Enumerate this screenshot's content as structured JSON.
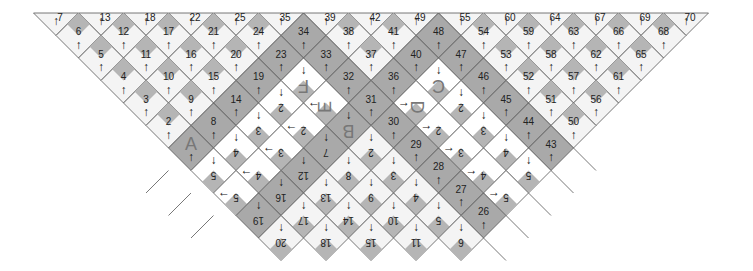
{
  "diagram": {
    "colors": {
      "dark": "#a9a9a9",
      "light": "#f4f4f4",
      "white": "#ffffff",
      "patch": "#b5b5b5",
      "line": "#555555"
    },
    "geometry": {
      "x0": 56,
      "y0": 13,
      "step": 22.5
    },
    "top_labels": [
      {
        "t": "7",
        "c": 0
      },
      {
        "t": "13",
        "c": 2
      },
      {
        "t": "18",
        "c": 4
      },
      {
        "t": "22",
        "c": 6
      },
      {
        "t": "25",
        "c": 8
      },
      {
        "t": "35",
        "c": 10
      },
      {
        "t": "39",
        "c": 12
      },
      {
        "t": "42",
        "c": 14
      },
      {
        "t": "49",
        "c": 16
      },
      {
        "t": "55",
        "c": 18
      },
      {
        "t": "60",
        "c": 20
      },
      {
        "t": "64",
        "c": 22
      },
      {
        "t": "67",
        "c": 24
      },
      {
        "t": "69",
        "c": 26
      },
      {
        "t": "70",
        "c": 28
      }
    ],
    "cells": [
      {
        "t": "6",
        "c": 1,
        "r": 1,
        "f": "light",
        "a": "up"
      },
      {
        "t": "12",
        "c": 3,
        "r": 1,
        "f": "light",
        "a": "up"
      },
      {
        "t": "17",
        "c": 5,
        "r": 1,
        "f": "light",
        "a": "up"
      },
      {
        "t": "21",
        "c": 7,
        "r": 1,
        "f": "light",
        "a": "up"
      },
      {
        "t": "24",
        "c": 9,
        "r": 1,
        "f": "light",
        "a": "up"
      },
      {
        "t": "34",
        "c": 11,
        "r": 1,
        "f": "dark",
        "a": "up"
      },
      {
        "t": "38",
        "c": 13,
        "r": 1,
        "f": "light",
        "a": "up"
      },
      {
        "t": "41",
        "c": 15,
        "r": 1,
        "f": "light",
        "a": "up"
      },
      {
        "t": "48",
        "c": 17,
        "r": 1,
        "f": "dark",
        "a": "up"
      },
      {
        "t": "54",
        "c": 19,
        "r": 1,
        "f": "light",
        "a": "up"
      },
      {
        "t": "59",
        "c": 21,
        "r": 1,
        "f": "light",
        "a": "up"
      },
      {
        "t": "63",
        "c": 23,
        "r": 1,
        "f": "light",
        "a": "up"
      },
      {
        "t": "66",
        "c": 25,
        "r": 1,
        "f": "light",
        "a": "up"
      },
      {
        "t": "68",
        "c": 27,
        "r": 1,
        "f": "light",
        "a": "up"
      },
      {
        "t": "5",
        "c": 2,
        "r": 2,
        "f": "light",
        "a": "up"
      },
      {
        "t": "11",
        "c": 4,
        "r": 2,
        "f": "light",
        "a": "up"
      },
      {
        "t": "16",
        "c": 6,
        "r": 2,
        "f": "light",
        "a": "up"
      },
      {
        "t": "20",
        "c": 8,
        "r": 2,
        "f": "light",
        "a": "up"
      },
      {
        "t": "23",
        "c": 10,
        "r": 2,
        "f": "dark",
        "a": "up"
      },
      {
        "t": "33",
        "c": 12,
        "r": 2,
        "f": "dark",
        "a": "up"
      },
      {
        "t": "37",
        "c": 14,
        "r": 2,
        "f": "light",
        "a": "up"
      },
      {
        "t": "40",
        "c": 16,
        "r": 2,
        "f": "dark",
        "a": "up"
      },
      {
        "t": "47",
        "c": 18,
        "r": 2,
        "f": "dark",
        "a": "up"
      },
      {
        "t": "53",
        "c": 20,
        "r": 2,
        "f": "light",
        "a": "up"
      },
      {
        "t": "58",
        "c": 22,
        "r": 2,
        "f": "light",
        "a": "up"
      },
      {
        "t": "62",
        "c": 24,
        "r": 2,
        "f": "light",
        "a": "up"
      },
      {
        "t": "65",
        "c": 26,
        "r": 2,
        "f": "light",
        "a": "up"
      },
      {
        "t": "4",
        "c": 3,
        "r": 3,
        "f": "light",
        "a": "up"
      },
      {
        "t": "10",
        "c": 5,
        "r": 3,
        "f": "light",
        "a": "up"
      },
      {
        "t": "15",
        "c": 7,
        "r": 3,
        "f": "light",
        "a": "up"
      },
      {
        "t": "19",
        "c": 9,
        "r": 3,
        "f": "dark",
        "a": "up"
      },
      {
        "t": "F",
        "c": 11,
        "r": 3,
        "f": "white",
        "a": "down",
        "big": true,
        "flip": true
      },
      {
        "t": "32",
        "c": 13,
        "r": 3,
        "f": "dark",
        "a": "up"
      },
      {
        "t": "36",
        "c": 15,
        "r": 3,
        "f": "dark",
        "a": "up"
      },
      {
        "t": "C",
        "c": 17,
        "r": 3,
        "f": "white",
        "a": "down",
        "big": true,
        "flip": true
      },
      {
        "t": "46",
        "c": 19,
        "r": 3,
        "f": "dark",
        "a": "up"
      },
      {
        "t": "52",
        "c": 21,
        "r": 3,
        "f": "light",
        "a": "up"
      },
      {
        "t": "57",
        "c": 23,
        "r": 3,
        "f": "light",
        "a": "up"
      },
      {
        "t": "61",
        "c": 25,
        "r": 3,
        "f": "light",
        "a": "up"
      },
      {
        "t": "3",
        "c": 4,
        "r": 4,
        "f": "light",
        "a": "up"
      },
      {
        "t": "9",
        "c": 6,
        "r": 4,
        "f": "light",
        "a": "up"
      },
      {
        "t": "14",
        "c": 8,
        "r": 4,
        "f": "dark",
        "a": "up"
      },
      {
        "t": "2",
        "c": 10,
        "r": 4,
        "f": "white",
        "a": "down",
        "flip": true
      },
      {
        "t": "E",
        "c": 12,
        "r": 4,
        "f": "white",
        "a": "left",
        "big": true,
        "rot": true
      },
      {
        "t": "31",
        "c": 14,
        "r": 4,
        "f": "dark",
        "a": "up"
      },
      {
        "t": "D",
        "c": 16,
        "r": 4,
        "f": "white",
        "a": "right",
        "big": true,
        "rot2": true
      },
      {
        "t": "2",
        "c": 18,
        "r": 4,
        "f": "white",
        "a": "down",
        "flip": true
      },
      {
        "t": "45",
        "c": 20,
        "r": 4,
        "f": "dark",
        "a": "up"
      },
      {
        "t": "51",
        "c": 22,
        "r": 4,
        "f": "light",
        "a": "up"
      },
      {
        "t": "56",
        "c": 24,
        "r": 4,
        "f": "light",
        "a": "up"
      },
      {
        "t": "2",
        "c": 5,
        "r": 5,
        "f": "light",
        "a": "up"
      },
      {
        "t": "8",
        "c": 7,
        "r": 5,
        "f": "dark",
        "a": "up"
      },
      {
        "t": "3",
        "c": 9,
        "r": 5,
        "f": "white",
        "a": "down",
        "flip": true
      },
      {
        "t": "2",
        "c": 11,
        "r": 5,
        "f": "white",
        "a": "left",
        "flip": true
      },
      {
        "t": "B",
        "c": 13,
        "r": 5,
        "f": "dark",
        "a": "down",
        "big": true,
        "flip": true
      },
      {
        "t": "30",
        "c": 15,
        "r": 5,
        "f": "dark",
        "a": "up"
      },
      {
        "t": "2",
        "c": 17,
        "r": 5,
        "f": "white",
        "a": "right",
        "flip": true
      },
      {
        "t": "3",
        "c": 19,
        "r": 5,
        "f": "white",
        "a": "down",
        "flip": true
      },
      {
        "t": "44",
        "c": 21,
        "r": 5,
        "f": "dark",
        "a": "up"
      },
      {
        "t": "50",
        "c": 23,
        "r": 5,
        "f": "light",
        "a": "up"
      },
      {
        "t": "A",
        "c": 6,
        "r": 6,
        "f": "dark",
        "a": "up",
        "big": true
      },
      {
        "t": "4",
        "c": 8,
        "r": 6,
        "f": "white",
        "a": "down",
        "flip": true
      },
      {
        "t": "3",
        "c": 10,
        "r": 6,
        "f": "white",
        "a": "left",
        "flip": true
      },
      {
        "t": "7",
        "c": 12,
        "r": 6,
        "f": "dark",
        "a": "down",
        "flip": true
      },
      {
        "t": "2",
        "c": 14,
        "r": 6,
        "f": "light",
        "a": "down",
        "flip": true
      },
      {
        "t": "29",
        "c": 16,
        "r": 6,
        "f": "dark",
        "a": "up"
      },
      {
        "t": "3",
        "c": 18,
        "r": 6,
        "f": "white",
        "a": "right",
        "flip": true
      },
      {
        "t": "4",
        "c": 20,
        "r": 6,
        "f": "white",
        "a": "down",
        "flip": true
      },
      {
        "t": "43",
        "c": 22,
        "r": 6,
        "f": "dark",
        "a": "up"
      },
      {
        "t": "5",
        "c": 7,
        "r": 7,
        "f": "white",
        "a": "down",
        "flip": true
      },
      {
        "t": "4",
        "c": 9,
        "r": 7,
        "f": "white",
        "a": "left",
        "flip": true
      },
      {
        "t": "12",
        "c": 11,
        "r": 7,
        "f": "dark",
        "a": "down",
        "flip": true
      },
      {
        "t": "8",
        "c": 13,
        "r": 7,
        "f": "light",
        "a": "down",
        "flip": true
      },
      {
        "t": "3",
        "c": 15,
        "r": 7,
        "f": "light",
        "a": "down",
        "flip": true
      },
      {
        "t": "28",
        "c": 17,
        "r": 7,
        "f": "dark",
        "a": "up"
      },
      {
        "t": "4",
        "c": 19,
        "r": 7,
        "f": "white",
        "a": "right",
        "flip": true
      },
      {
        "t": "5",
        "c": 21,
        "r": 7,
        "f": "white",
        "a": "down",
        "flip": true
      },
      {
        "t": "5",
        "c": 8,
        "r": 8,
        "f": "white",
        "a": "left",
        "flip": true
      },
      {
        "t": "16",
        "c": 10,
        "r": 8,
        "f": "dark",
        "a": "down",
        "flip": true
      },
      {
        "t": "13",
        "c": 12,
        "r": 8,
        "f": "light",
        "a": "down",
        "flip": true
      },
      {
        "t": "9",
        "c": 14,
        "r": 8,
        "f": "light",
        "a": "down",
        "flip": true
      },
      {
        "t": "4",
        "c": 16,
        "r": 8,
        "f": "light",
        "a": "down",
        "flip": true
      },
      {
        "t": "27",
        "c": 18,
        "r": 8,
        "f": "dark",
        "a": "up"
      },
      {
        "t": "5",
        "c": 20,
        "r": 8,
        "f": "white",
        "a": "right",
        "flip": true
      },
      {
        "t": "19",
        "c": 9,
        "r": 9,
        "f": "dark",
        "a": "down",
        "flip": true
      },
      {
        "t": "17",
        "c": 11,
        "r": 9,
        "f": "light",
        "a": "down",
        "flip": true
      },
      {
        "t": "14",
        "c": 13,
        "r": 9,
        "f": "light",
        "a": "down",
        "flip": true
      },
      {
        "t": "10",
        "c": 15,
        "r": 9,
        "f": "light",
        "a": "down",
        "flip": true
      },
      {
        "t": "5",
        "c": 17,
        "r": 9,
        "f": "light",
        "a": "down",
        "flip": true
      },
      {
        "t": "26",
        "c": 19,
        "r": 9,
        "f": "dark",
        "a": "up"
      },
      {
        "t": "20",
        "c": 10,
        "r": 10,
        "f": "light",
        "a": "down",
        "flip": true
      },
      {
        "t": "18",
        "c": 12,
        "r": 10,
        "f": "light",
        "a": "down",
        "flip": true
      },
      {
        "t": "15",
        "c": 14,
        "r": 10,
        "f": "light",
        "a": "down",
        "flip": true
      },
      {
        "t": "11",
        "c": 16,
        "r": 10,
        "f": "light",
        "a": "down",
        "flip": true
      },
      {
        "t": "6",
        "c": 18,
        "r": 10,
        "f": "light",
        "a": "down",
        "flip": true
      }
    ],
    "arrows": {
      "up": "↑",
      "down": "↓",
      "left": "←",
      "right": "→"
    }
  }
}
